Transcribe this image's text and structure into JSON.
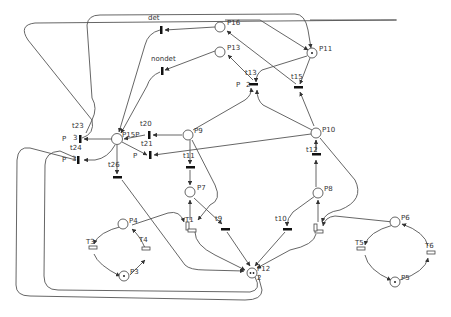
{
  "diagram": {
    "type": "petri-net",
    "places": [
      {
        "id": "P16",
        "label": "P16",
        "tokens": 0
      },
      {
        "id": "P13",
        "label": "P13",
        "tokens": 0
      },
      {
        "id": "P11",
        "label": "P11",
        "tokens": 1
      },
      {
        "id": "P15P",
        "label": "P15P",
        "tokens": 0
      },
      {
        "id": "P9",
        "label": "P9",
        "tokens": 0
      },
      {
        "id": "P10",
        "label": "P10",
        "tokens": 0
      },
      {
        "id": "P7",
        "label": "P7",
        "tokens": 0
      },
      {
        "id": "P8",
        "label": "P8",
        "tokens": 0
      },
      {
        "id": "P4",
        "label": "P4",
        "tokens": 0
      },
      {
        "id": "P3",
        "label": "P3",
        "tokens": 1
      },
      {
        "id": "P12",
        "label": "P12",
        "tokens": 2
      },
      {
        "id": "P6",
        "label": "P6",
        "tokens": 0
      },
      {
        "id": "P5",
        "label": "P5",
        "tokens": 1
      }
    ],
    "transitions": [
      {
        "id": "det",
        "label": "det",
        "kind": "immediate"
      },
      {
        "id": "nondet",
        "label": "nondet",
        "kind": "immediate"
      },
      {
        "id": "t13",
        "label": "t13",
        "kind": "immediate",
        "priority": "P",
        "weight": "2"
      },
      {
        "id": "t15",
        "label": "t15",
        "kind": "immediate"
      },
      {
        "id": "t23",
        "label": "t23",
        "kind": "immediate",
        "priority": "P",
        "weight": "3"
      },
      {
        "id": "t24",
        "label": "t24",
        "kind": "immediate",
        "priority": "P",
        "weight": "3"
      },
      {
        "id": "t20",
        "label": "t20",
        "kind": "immediate"
      },
      {
        "id": "t21",
        "label": "t21",
        "kind": "immediate",
        "priority": "P"
      },
      {
        "id": "t26",
        "label": "t26",
        "kind": "immediate"
      },
      {
        "id": "t11",
        "label": "t11",
        "kind": "immediate"
      },
      {
        "id": "t12",
        "label": "t12",
        "kind": "immediate"
      },
      {
        "id": "t9",
        "label": "t9",
        "kind": "immediate"
      },
      {
        "id": "t10",
        "label": "t10",
        "kind": "immediate"
      },
      {
        "id": "T1",
        "label": "T1",
        "kind": "timed"
      },
      {
        "id": "T2",
        "label": "T2",
        "kind": "timed"
      },
      {
        "id": "T3",
        "label": "T3",
        "kind": "timed"
      },
      {
        "id": "T4",
        "label": "T4",
        "kind": "timed"
      },
      {
        "id": "T5",
        "label": "T5",
        "kind": "timed"
      },
      {
        "id": "T6",
        "label": "T6",
        "kind": "timed"
      }
    ],
    "annotations": {
      "p_label": "P",
      "w2": "2",
      "w3": "3",
      "p12_weight": "2"
    }
  }
}
